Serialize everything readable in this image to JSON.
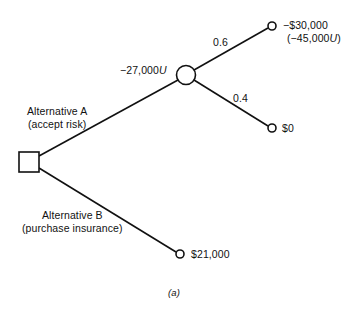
{
  "diagram": {
    "type": "decision-tree",
    "caption": "(a)",
    "decision_node": {
      "shape": "square",
      "icon": "decision-square-icon"
    },
    "branches": [
      {
        "id": "alt-a",
        "label_line1": "Alternative A",
        "label_line2": "(accept risk)",
        "leads_to": "chance-node"
      },
      {
        "id": "alt-b",
        "label_line1": "Alternative B",
        "label_line2": "(purchase insurance)",
        "outcome": "$21,000"
      }
    ],
    "chance_node": {
      "shape": "circle",
      "icon": "chance-circle-icon",
      "expected_utility_prefix": "−27,000",
      "expected_utility_unit": "U"
    },
    "chance_branches": [
      {
        "probability": "0.6",
        "outcome": "−$30,000",
        "utility_prefix": "(−45,000",
        "utility_unit": "U",
        "utility_suffix": ")"
      },
      {
        "probability": "0.4",
        "outcome": "$0"
      }
    ],
    "colors": {
      "line": "#111111",
      "background": "#ffffff"
    }
  }
}
